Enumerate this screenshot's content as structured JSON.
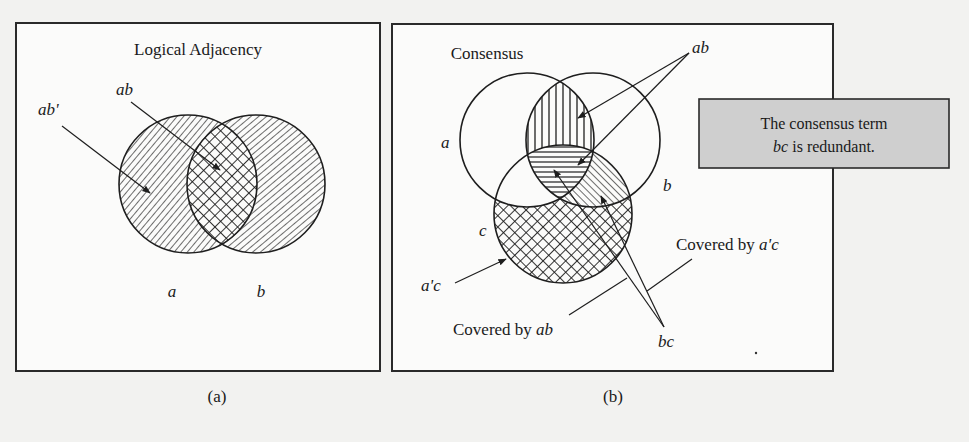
{
  "panel_a": {
    "title": "Logical Adjacency",
    "caption": "(a)",
    "labels": {
      "ab_prime": "ab'",
      "ab": "ab",
      "a": "a",
      "b": "b"
    }
  },
  "panel_b": {
    "title": "Consensus",
    "caption": "(b)",
    "labels": {
      "a": "a",
      "b": "b",
      "c": "c",
      "ab": "ab",
      "a_prime_c": "a'c",
      "bc": "bc",
      "covered_by_ab_prefix": "Covered by ",
      "covered_by_ab_term": "ab",
      "covered_by_apc_prefix": "Covered by ",
      "covered_by_apc_term": "a'c"
    }
  },
  "note_box": {
    "line1": "The consensus term",
    "line2_term": "bc",
    "line2_rest": " is redundant.",
    "fill": "#cfcfcf"
  },
  "colors": {
    "ink": "#1e1e1e",
    "page": "#f2f2f0",
    "panel": "#fbfbfa"
  }
}
